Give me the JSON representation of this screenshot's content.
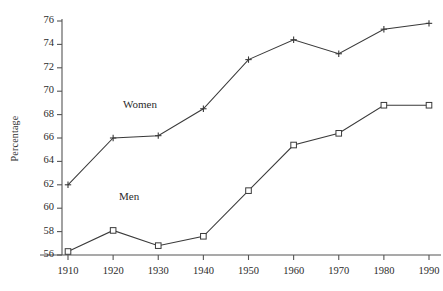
{
  "chart_data": {
    "type": "line",
    "title": "",
    "subtitle": "",
    "xlabel": "",
    "ylabel": "Percentage",
    "x": [
      1910,
      1920,
      1930,
      1940,
      1950,
      1960,
      1970,
      1980,
      1990
    ],
    "categories": [
      "1910",
      "1920",
      "1930",
      "1940",
      "1950",
      "1960",
      "1970",
      "1980",
      "1990"
    ],
    "series": [
      {
        "name": "Women",
        "marker": "plus",
        "color": "#3a3a3a",
        "annotation": "Women",
        "values": [
          62.0,
          66.0,
          66.2,
          68.5,
          72.7,
          74.4,
          73.2,
          75.3,
          75.8
        ]
      },
      {
        "name": "Men",
        "marker": "open-square",
        "color": "#3a3a3a",
        "annotation": "Men",
        "values": [
          56.3,
          58.1,
          56.8,
          57.6,
          61.5,
          65.4,
          66.4,
          68.8,
          68.8
        ]
      }
    ],
    "xlim": [
      1905,
      1995
    ],
    "ylim": [
      56,
      76
    ],
    "y_ticks": [
      56,
      58,
      60,
      62,
      64,
      66,
      68,
      70,
      72,
      74,
      76
    ],
    "x_ticks": [
      1910,
      1920,
      1930,
      1940,
      1950,
      1960,
      1970,
      1980,
      1990
    ],
    "grid": false,
    "legend": "inline-annotations",
    "legend_position": "inside-plot"
  },
  "axes": {
    "y_title": "Percentage",
    "y_tick_labels": [
      "76",
      "74",
      "72",
      "70",
      "68",
      "66",
      "64",
      "62",
      "60",
      "58",
      "56"
    ],
    "x_tick_labels": [
      "1910",
      "1920",
      "1930",
      "1940",
      "1950",
      "1960",
      "1970",
      "1980",
      "1990"
    ]
  },
  "annotations": {
    "women_label": "Women",
    "men_label": "Men"
  },
  "colors": {
    "line": "#3a3a3a",
    "axis": "#555555",
    "text": "#2b2b2b",
    "background": "#ffffff",
    "marker_fill": "#ffffff"
  }
}
